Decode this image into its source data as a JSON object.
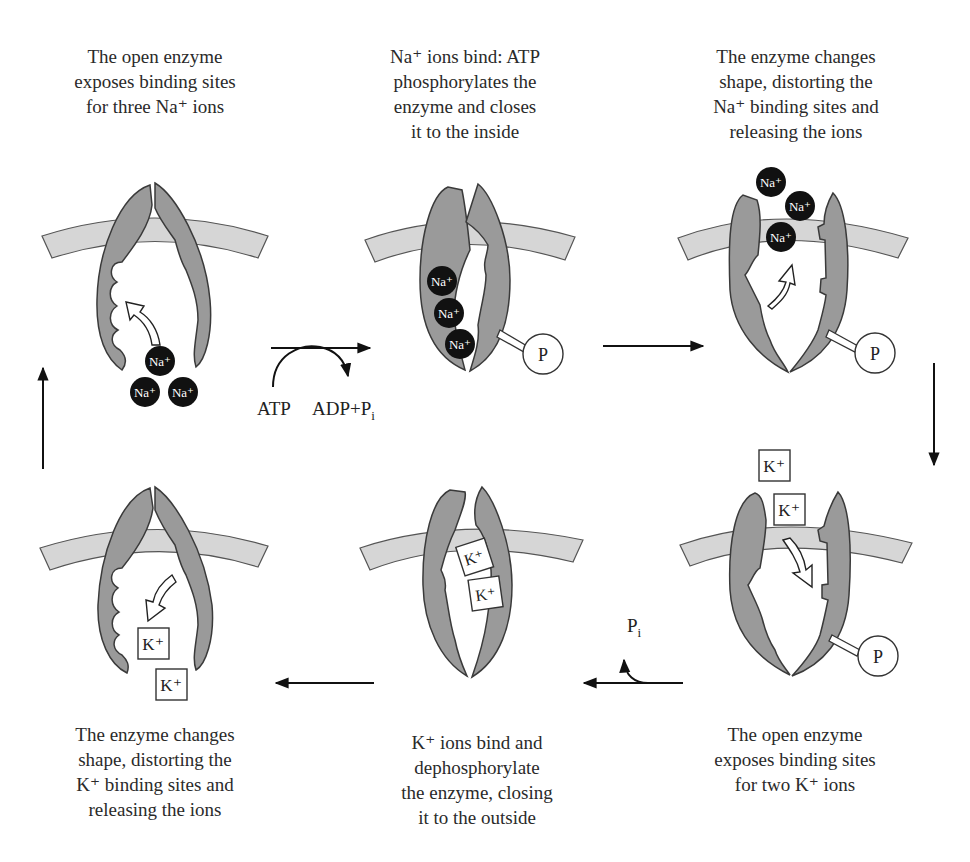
{
  "colors": {
    "enzyme_fill": "#9a9a9a",
    "membrane_fill": "#d6d6d6",
    "outline": "#3a3a3a",
    "na_ion_fill": "#111111",
    "text": "#2a2a2a"
  },
  "steps": [
    {
      "id": "step1",
      "caption_lines": [
        "The open enzyme",
        "exposes binding sites",
        "for three Na⁺ ions"
      ],
      "ions": [
        "Na⁺",
        "Na⁺",
        "Na⁺"
      ]
    },
    {
      "id": "step2",
      "caption_lines": [
        "Na⁺ ions bind: ATP",
        "phosphorylates the",
        "enzyme and closes",
        "it to the inside"
      ],
      "ions": [
        "Na⁺",
        "Na⁺",
        "Na⁺"
      ],
      "phosphate": "P"
    },
    {
      "id": "step3",
      "caption_lines": [
        "The enzyme changes",
        "shape, distorting the",
        "Na⁺ binding sites and",
        "releasing the ions"
      ],
      "ions": [
        "Na⁺",
        "Na⁺",
        "Na⁺"
      ],
      "phosphate": "P"
    },
    {
      "id": "step4",
      "caption_lines": [
        "The open enzyme",
        "exposes binding sites",
        "for two K⁺ ions"
      ],
      "ions": [
        "K⁺",
        "K⁺"
      ],
      "phosphate": "P"
    },
    {
      "id": "step5",
      "caption_lines": [
        "K⁺ ions bind and",
        "dephosphorylate",
        "the enzyme, closing",
        "it to the outside"
      ],
      "ions": [
        "K⁺",
        "K⁺"
      ]
    },
    {
      "id": "step6",
      "caption_lines": [
        "The enzyme changes",
        "shape, distorting the",
        "K⁺ binding sites and",
        "releasing the ions"
      ],
      "ions": [
        "K⁺",
        "K⁺"
      ]
    }
  ],
  "transitions": {
    "atp_in": "ATP",
    "adp_out": "ADP+P",
    "adp_sub": "i",
    "pi_out": "P",
    "pi_sub": "i"
  }
}
